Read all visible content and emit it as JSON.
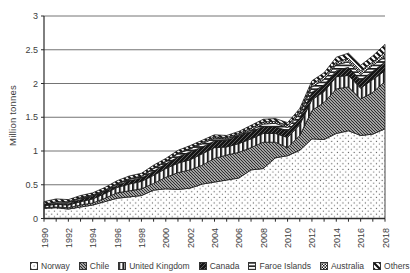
{
  "chart": {
    "y_axis_title": "Million tonnes",
    "y_tick_labels": [
      "0",
      "0.5",
      "1",
      "1.5",
      "2",
      "2.5",
      "3"
    ],
    "x_tick_labels": [
      "1990",
      "1992",
      "1994",
      "1996",
      "1998",
      "2000",
      "2002",
      "2004",
      "2006",
      "2008",
      "2010",
      "2012",
      "2014",
      "2016",
      "2018"
    ],
    "text_color": "#3d3d3d",
    "gridline_color": "#646464",
    "axis_color": "#2b2b2b"
  },
  "chart_data": {
    "type": "area",
    "stacked": true,
    "title": "",
    "xlabel": "",
    "ylabel": "Million tonnes",
    "ylim": [
      0,
      3
    ],
    "y_grid_step": 0.5,
    "grid": true,
    "legend_position": "bottom",
    "x_label_every": 2,
    "x": [
      1990,
      1991,
      1992,
      1993,
      1994,
      1995,
      1996,
      1997,
      1998,
      1999,
      2000,
      2001,
      2002,
      2003,
      2004,
      2005,
      2006,
      2007,
      2008,
      2009,
      2010,
      2011,
      2012,
      2013,
      2014,
      2015,
      2016,
      2017,
      2018
    ],
    "series": [
      {
        "name": "Norway",
        "pattern": "dots",
        "values": [
          0.15,
          0.16,
          0.14,
          0.17,
          0.2,
          0.25,
          0.3,
          0.32,
          0.34,
          0.42,
          0.44,
          0.43,
          0.45,
          0.51,
          0.54,
          0.57,
          0.6,
          0.72,
          0.74,
          0.9,
          0.93,
          1.01,
          1.18,
          1.17,
          1.26,
          1.3,
          1.23,
          1.25,
          1.33
        ]
      },
      {
        "name": "Chile",
        "pattern": "diagonal-dense",
        "values": [
          0.01,
          0.01,
          0.02,
          0.03,
          0.03,
          0.05,
          0.08,
          0.09,
          0.1,
          0.1,
          0.17,
          0.25,
          0.27,
          0.28,
          0.35,
          0.37,
          0.38,
          0.33,
          0.39,
          0.23,
          0.12,
          0.22,
          0.42,
          0.55,
          0.66,
          0.65,
          0.54,
          0.62,
          0.7
        ]
      },
      {
        "name": "United Kingdom",
        "pattern": "vertical-stripes",
        "values": [
          0.03,
          0.04,
          0.04,
          0.05,
          0.06,
          0.07,
          0.08,
          0.1,
          0.11,
          0.12,
          0.13,
          0.14,
          0.15,
          0.17,
          0.16,
          0.12,
          0.13,
          0.13,
          0.13,
          0.13,
          0.15,
          0.16,
          0.16,
          0.16,
          0.18,
          0.17,
          0.16,
          0.19,
          0.16
        ]
      },
      {
        "name": "Canada",
        "pattern": "solid-dark",
        "values": [
          0.01,
          0.02,
          0.02,
          0.03,
          0.04,
          0.03,
          0.03,
          0.05,
          0.05,
          0.06,
          0.07,
          0.09,
          0.12,
          0.1,
          0.1,
          0.1,
          0.12,
          0.11,
          0.1,
          0.1,
          0.1,
          0.1,
          0.11,
          0.1,
          0.09,
          0.12,
          0.12,
          0.12,
          0.13
        ]
      },
      {
        "name": "Faroe Islands",
        "pattern": "horizontal-stripes",
        "values": [
          0.01,
          0.02,
          0.02,
          0.02,
          0.01,
          0.01,
          0.02,
          0.02,
          0.02,
          0.04,
          0.03,
          0.05,
          0.04,
          0.05,
          0.04,
          0.02,
          0.01,
          0.02,
          0.04,
          0.05,
          0.05,
          0.06,
          0.08,
          0.08,
          0.09,
          0.08,
          0.08,
          0.09,
          0.08
        ]
      },
      {
        "name": "Australia",
        "pattern": "checker",
        "values": [
          0.0,
          0.0,
          0.01,
          0.01,
          0.01,
          0.01,
          0.01,
          0.01,
          0.01,
          0.01,
          0.01,
          0.01,
          0.01,
          0.02,
          0.02,
          0.02,
          0.02,
          0.03,
          0.03,
          0.03,
          0.03,
          0.04,
          0.04,
          0.04,
          0.04,
          0.05,
          0.06,
          0.05,
          0.06
        ]
      },
      {
        "name": "Others",
        "pattern": "diagonal-wide",
        "values": [
          0.04,
          0.04,
          0.03,
          0.03,
          0.03,
          0.04,
          0.04,
          0.04,
          0.04,
          0.04,
          0.04,
          0.04,
          0.04,
          0.03,
          0.03,
          0.03,
          0.03,
          0.04,
          0.04,
          0.04,
          0.04,
          0.04,
          0.05,
          0.06,
          0.07,
          0.08,
          0.08,
          0.09,
          0.12
        ]
      }
    ]
  }
}
